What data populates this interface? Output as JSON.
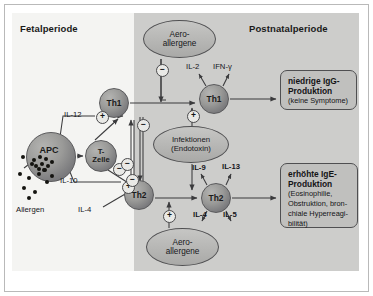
{
  "figure": {
    "panels": {
      "fetal": {
        "title": "Fetalperiode"
      },
      "postnatal": {
        "title": "Postnatalperiode"
      }
    },
    "nodes": {
      "apc": "APC",
      "tzelle_line1": "T-",
      "tzelle_line2": "Zelle",
      "th1_left": "Th1",
      "th2_left": "Th2",
      "th1_right": "Th1",
      "th2_right": "Th2",
      "aero_top_line1": "Aero-",
      "aero_top_line2": "allergene",
      "infektionen_line1": "Infektionen",
      "infektionen_line2": "(Endotoxin)",
      "aero_bottom_line1": "Aero-",
      "aero_bottom_line2": "allergene"
    },
    "outcomes": {
      "igg": {
        "title": "niedrige IgG-",
        "title2": "Produktion",
        "subtitle": "(keine Symptome)"
      },
      "ige": {
        "title": "erhöhte IgE-",
        "title2": "Produktion",
        "subtitle": "(Eosinophilie, Obstruktion, bron-chiale Hyperreagi-bilität)",
        "sub_l1": "(Eosinophilie,",
        "sub_l2": "Obstruktion, bron-",
        "sub_l3": "chiale Hyperreagi-",
        "sub_l4": "bilität)"
      }
    },
    "labels": {
      "il12": "IL-12",
      "il10": "IL-10",
      "il4_left": "IL-4",
      "allergen": "Allergen",
      "il2": "IL-2",
      "ifng": "IFN-γ",
      "il9": "IL-9",
      "il13": "IL-13",
      "il4_right": "IL-4",
      "il5": "IL-5"
    },
    "signs": {
      "il12_plus": "+",
      "il10_plus": "+",
      "il4_minus": "−",
      "aero_top_minus": "−",
      "infekt_plus": "+",
      "infekt_minus": "−",
      "aero_bottom_plus": "+",
      "th1_inhibits_th2": "−",
      "th2_inhibits_th1": "−"
    },
    "colors": {
      "panel_fetal_bg": "#f4f4f2",
      "panel_postnatal_bg": "#cdcdcb",
      "cell_fill": "#9a9a98",
      "outcome_fill": "#c0c0be",
      "stroke": "#4f4f51",
      "text": "#141416"
    }
  }
}
